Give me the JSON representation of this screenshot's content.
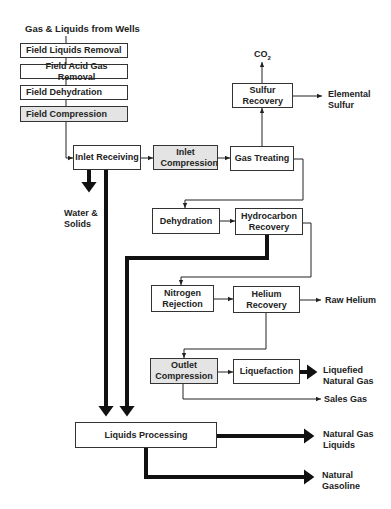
{
  "title_input": "Gas & Liquids from Wells",
  "field_units": [
    {
      "label": "Field Liquids Removal",
      "shaded": false
    },
    {
      "label": "Field Acid Gas Removal",
      "shaded": false
    },
    {
      "label": "Field Dehydration",
      "shaded": false
    },
    {
      "label": "Field Compression",
      "shaded": true
    }
  ],
  "units": {
    "inlet_receiving": "Inlet Receiving",
    "inlet_compression": "Inlet Compression",
    "gas_treating": "Gas Treating",
    "sulfur_recovery": "Sulfur Recovery",
    "dehydration": "Dehydration",
    "hydrocarbon_recovery": "Hydrocarbon Recovery",
    "nitrogen_rejection": "Nitrogen Rejection",
    "helium_recovery": "Helium Recovery",
    "outlet_compression": "Outlet Compression",
    "liquefaction": "Liquefaction",
    "liquids_processing": "Liquids Processing"
  },
  "products": {
    "co2": "CO",
    "co2_sub": "2",
    "elemental_sulfur": "Elemental Sulfur",
    "water_solids": "Water & Solids",
    "raw_helium": "Raw Helium",
    "lng": "Liquefied Natural Gas",
    "sales_gas": "Sales Gas",
    "ngl": "Natural Gas Liquids",
    "natural_gasoline": "Natural Gasoline"
  },
  "legend": {
    "thin_line": "gas stream",
    "thick_line": "liquid stream",
    "shaded_box": "compression step"
  },
  "colors": {
    "line": "#222222",
    "box_border": "#333333",
    "shaded_fill": "#e4e4e4"
  }
}
